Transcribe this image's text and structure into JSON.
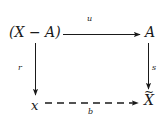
{
  "diagram": {
    "type": "commutative-square",
    "nodes": {
      "top_left": "(X − A)",
      "top_right": "A",
      "bottom_left": "x",
      "bottom_right_base": "X",
      "bottom_right_accent": "~",
      "bottom_right": "X̃"
    },
    "arrows": [
      {
        "id": "top",
        "from": "top_left",
        "to": "top_right",
        "label": "u",
        "style": "solid",
        "direction": "right"
      },
      {
        "id": "left",
        "from": "top_left",
        "to": "bottom_left",
        "label": "r",
        "style": "solid",
        "direction": "down"
      },
      {
        "id": "right",
        "from": "top_right",
        "to": "bottom_right",
        "label": "s",
        "style": "solid",
        "direction": "down"
      },
      {
        "id": "bottom",
        "from": "bottom_left",
        "to": "bottom_right",
        "label": "b",
        "style": "dashed",
        "direction": "right"
      }
    ],
    "colors": {
      "ink": "#1a1a1a",
      "background": "#ffffff"
    }
  }
}
